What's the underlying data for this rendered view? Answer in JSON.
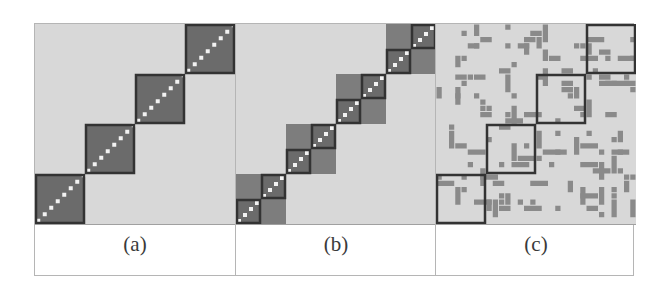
{
  "figure": {
    "panels": [
      {
        "id": "a",
        "label": "(a)",
        "description": "block-diagonal matrix, 4 blocks",
        "blocks": 4
      },
      {
        "id": "b",
        "label": "(b)",
        "description": "block-diagonal matrix, 4 super-blocks each split into 2x2 sub-blocks",
        "blocks": 4,
        "sub_blocks": 2
      },
      {
        "id": "c",
        "label": "(c)",
        "description": "sparse matrix with 4 outlined diagonal blocks",
        "blocks": 4
      }
    ],
    "colors": {
      "background": "#d8d8d8",
      "block_fill": "#6b6b6b",
      "block_fill_light": "#7d7d7d",
      "outline": "#333333",
      "diagonal_dot": "#f2f2f2",
      "sparse_cell": "#8a8a8a"
    }
  }
}
